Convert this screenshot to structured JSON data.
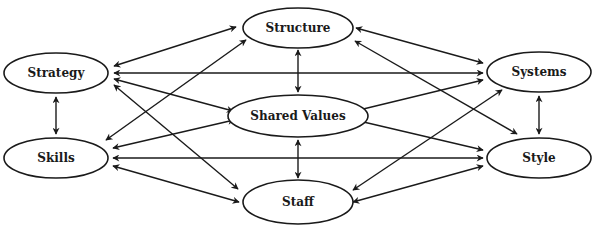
{
  "diagram": {
    "type": "network",
    "title": "",
    "colors": {
      "stroke": "#1a1a1a",
      "fill": "#ffffff",
      "text": "#1a1a1a"
    },
    "nodes": [
      {
        "id": "strategy",
        "label": "Strategy",
        "cx": 56,
        "cy": 73,
        "rx": 52,
        "ry": 20
      },
      {
        "id": "structure",
        "label": "Structure",
        "cx": 298,
        "cy": 28,
        "rx": 55,
        "ry": 20
      },
      {
        "id": "systems",
        "label": "Systems",
        "cx": 539,
        "cy": 72,
        "rx": 52,
        "ry": 20
      },
      {
        "id": "shared_values",
        "label": "Shared Values",
        "cx": 298,
        "cy": 116,
        "rx": 70,
        "ry": 21
      },
      {
        "id": "skills",
        "label": "Skills",
        "cx": 56,
        "cy": 158,
        "rx": 52,
        "ry": 20
      },
      {
        "id": "style",
        "label": "Style",
        "cx": 539,
        "cy": 158,
        "rx": 52,
        "ry": 20
      },
      {
        "id": "staff",
        "label": "Staff",
        "cx": 298,
        "cy": 202,
        "rx": 55,
        "ry": 22
      }
    ],
    "edges": [
      {
        "from": "strategy",
        "to": "structure",
        "directed": "both",
        "x1": 114,
        "y1": 66,
        "x2": 236,
        "y2": 27
      },
      {
        "from": "strategy",
        "to": "systems",
        "directed": "both",
        "x1": 114,
        "y1": 73,
        "x2": 483,
        "y2": 73
      },
      {
        "from": "strategy",
        "to": "shared_values",
        "directed": "both",
        "x1": 114,
        "y1": 79,
        "x2": 233,
        "y2": 111
      },
      {
        "from": "strategy",
        "to": "staff",
        "directed": "both",
        "x1": 114,
        "y1": 85,
        "x2": 238,
        "y2": 189
      },
      {
        "from": "strategy",
        "to": "skills",
        "directed": "both",
        "x1": 56,
        "y1": 97,
        "x2": 56,
        "y2": 134
      },
      {
        "from": "skills",
        "to": "structure",
        "directed": "both",
        "x1": 106,
        "y1": 140,
        "x2": 246,
        "y2": 40
      },
      {
        "from": "skills",
        "to": "shared_values",
        "directed": "both",
        "x1": 113,
        "y1": 148,
        "x2": 234,
        "y2": 120
      },
      {
        "from": "skills",
        "to": "style",
        "directed": "both",
        "x1": 113,
        "y1": 158,
        "x2": 483,
        "y2": 158
      },
      {
        "from": "skills",
        "to": "staff",
        "directed": "both",
        "x1": 113,
        "y1": 166,
        "x2": 239,
        "y2": 202
      },
      {
        "from": "structure",
        "to": "systems",
        "directed": "both",
        "x1": 356,
        "y1": 28,
        "x2": 483,
        "y2": 63
      },
      {
        "from": "structure",
        "to": "style",
        "directed": "both",
        "x1": 355,
        "y1": 41,
        "x2": 517,
        "y2": 134
      },
      {
        "from": "structure",
        "to": "shared_values",
        "directed": "both",
        "x1": 298,
        "y1": 50,
        "x2": 298,
        "y2": 92
      },
      {
        "from": "shared_values",
        "to": "systems",
        "directed": "both",
        "x1": 355,
        "y1": 111,
        "x2": 483,
        "y2": 80
      },
      {
        "from": "shared_values",
        "to": "style",
        "directed": "both",
        "x1": 355,
        "y1": 120,
        "x2": 483,
        "y2": 150
      },
      {
        "from": "shared_values",
        "to": "staff",
        "directed": "both",
        "x1": 298,
        "y1": 140,
        "x2": 298,
        "y2": 178
      },
      {
        "from": "staff",
        "to": "systems",
        "directed": "both",
        "x1": 353,
        "y1": 190,
        "x2": 502,
        "y2": 90
      },
      {
        "from": "staff",
        "to": "style",
        "directed": "both",
        "x1": 353,
        "y1": 202,
        "x2": 483,
        "y2": 166
      },
      {
        "from": "systems",
        "to": "style",
        "directed": "both",
        "x1": 539,
        "y1": 96,
        "x2": 539,
        "y2": 134
      }
    ]
  }
}
